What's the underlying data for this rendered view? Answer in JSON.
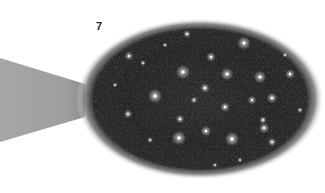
{
  "figure": {
    "label": "7",
    "colors": {
      "background": "#ffffff",
      "beam": "#a3a3a3",
      "field_dark": "#1a1a1a",
      "field_mid": "#3a3a3a",
      "star": "#ffffff",
      "label": "#222222"
    },
    "ellipse": {
      "cx": 200,
      "cy": 99,
      "rx": 122,
      "ry": 79
    },
    "beam": {
      "points": "0,58 85,84 85,117 0,142"
    },
    "stars": [
      {
        "x": 100,
        "y": 58,
        "r": 2.2
      },
      {
        "x": 129,
        "y": 56,
        "r": 1.8
      },
      {
        "x": 187,
        "y": 34,
        "r": 1.6
      },
      {
        "x": 183,
        "y": 72,
        "r": 3.0
      },
      {
        "x": 143,
        "y": 63,
        "r": 1.2
      },
      {
        "x": 155,
        "y": 96,
        "r": 3.0
      },
      {
        "x": 244,
        "y": 43,
        "r": 2.8
      },
      {
        "x": 211,
        "y": 57,
        "r": 2.0
      },
      {
        "x": 227,
        "y": 74,
        "r": 2.6
      },
      {
        "x": 260,
        "y": 77,
        "r": 2.6
      },
      {
        "x": 290,
        "y": 74,
        "r": 2.0
      },
      {
        "x": 205,
        "y": 88,
        "r": 2.0
      },
      {
        "x": 272,
        "y": 98,
        "r": 2.2
      },
      {
        "x": 252,
        "y": 100,
        "r": 1.8
      },
      {
        "x": 128,
        "y": 114,
        "r": 1.8
      },
      {
        "x": 180,
        "y": 119,
        "r": 1.8
      },
      {
        "x": 179,
        "y": 138,
        "r": 3.0
      },
      {
        "x": 206,
        "y": 131,
        "r": 2.2
      },
      {
        "x": 129,
        "y": 159,
        "r": 2.4
      },
      {
        "x": 194,
        "y": 100,
        "r": 1.4
      },
      {
        "x": 225,
        "y": 107,
        "r": 2.0
      },
      {
        "x": 232,
        "y": 139,
        "r": 3.0
      },
      {
        "x": 264,
        "y": 128,
        "r": 2.2
      },
      {
        "x": 272,
        "y": 142,
        "r": 1.8
      },
      {
        "x": 263,
        "y": 120,
        "r": 1.6
      },
      {
        "x": 165,
        "y": 45,
        "r": 1.0
      },
      {
        "x": 300,
        "y": 110,
        "r": 1.2
      },
      {
        "x": 240,
        "y": 160,
        "r": 1.0
      },
      {
        "x": 150,
        "y": 140,
        "r": 1.2
      },
      {
        "x": 215,
        "y": 165,
        "r": 1.0
      },
      {
        "x": 115,
        "y": 85,
        "r": 1.0
      },
      {
        "x": 285,
        "y": 55,
        "r": 1.0
      }
    ]
  }
}
